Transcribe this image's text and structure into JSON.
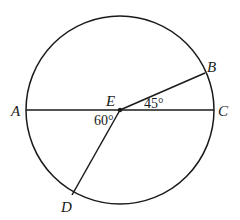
{
  "diagram": {
    "type": "circle-geometry",
    "center": {
      "name": "E",
      "x": 120,
      "y": 110
    },
    "radius": 94,
    "stroke_color": "#1a1a1a",
    "points": {
      "A": {
        "label": "A",
        "x": 26,
        "y": 110
      },
      "B": {
        "label": "B",
        "x": 205,
        "y": 73
      },
      "C": {
        "label": "C",
        "x": 214,
        "y": 110
      },
      "D": {
        "label": "D",
        "x": 72,
        "y": 195
      },
      "E": {
        "label": "E",
        "x": 120,
        "y": 110
      }
    },
    "segments": [
      {
        "name": "diameter-AC",
        "from": "A",
        "to": "C"
      },
      {
        "name": "radius-EB",
        "from": "E",
        "to": "B"
      },
      {
        "name": "radius-ED",
        "from": "E",
        "to": "D"
      }
    ],
    "angles": [
      {
        "name": "angle-BEC",
        "label": "45°",
        "vertex": "E",
        "between": [
          "B",
          "C"
        ]
      },
      {
        "name": "angle-AED",
        "label": "60°",
        "vertex": "E",
        "between": [
          "A",
          "D"
        ]
      }
    ]
  }
}
